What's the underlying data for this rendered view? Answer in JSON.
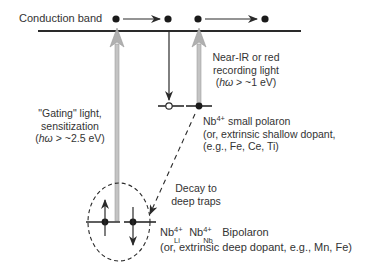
{
  "diagram": {
    "band_label": "Conduction band",
    "gating": {
      "line1": "\"Gating\" light,",
      "line2": "sensitization",
      "line3_open": "(",
      "line3_symbol": "hω",
      "line3_rest": " > ~2.5 eV)"
    },
    "recording": {
      "line1": "Near-IR or red",
      "line2": "recording light",
      "line3_open": "(",
      "line3_symbol": "hω",
      "line3_rest": " > ~1 eV)"
    },
    "small_polaron": {
      "species": "Nb",
      "charge": "4+",
      "title_rest": " small polaron",
      "line2": "(or, extrinsic shallow dopant,",
      "line3": "(e.g., Fe, Ce, Ti)"
    },
    "decay": {
      "line1": "Decay to",
      "line2": "deep traps"
    },
    "bipolaron": {
      "species1": "Nb",
      "charge1": "4+",
      "site1": "Li",
      "species2": "Nb",
      "charge2": "4+",
      "site2": "Nb",
      "title_rest": "Bipolaron",
      "line2": "(or, extrinsic deep dopant, e.g., Mn, Fe)"
    },
    "colors": {
      "line": "#2a2a2a",
      "light_arrow": "#b8b8b8",
      "light_arrow_edge": "#9a9a9a"
    }
  }
}
